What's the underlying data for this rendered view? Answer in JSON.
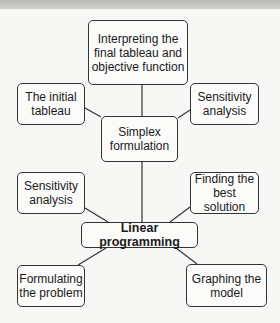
{
  "diagram": {
    "type": "mind-map",
    "center": "Linear programming",
    "nodes": [
      {
        "id": "linear",
        "label": "Linear programming"
      },
      {
        "id": "simplex",
        "label": "Simplex formulation"
      },
      {
        "id": "interpreting",
        "label": "Interpreting the final tableau and objective function"
      },
      {
        "id": "initial",
        "label": "The initial tableau"
      },
      {
        "id": "sens_right",
        "label": "Sensitivity analysis"
      },
      {
        "id": "sens_left",
        "label": "Sensitivity analysis"
      },
      {
        "id": "finding",
        "label": "Finding the best solution"
      },
      {
        "id": "formulating",
        "label": "Formulating the problem"
      },
      {
        "id": "graphing",
        "label": "Graphing the model"
      }
    ],
    "edges": [
      [
        "linear",
        "simplex"
      ],
      [
        "linear",
        "sens_left"
      ],
      [
        "linear",
        "finding"
      ],
      [
        "linear",
        "formulating"
      ],
      [
        "linear",
        "graphing"
      ],
      [
        "simplex",
        "interpreting"
      ],
      [
        "simplex",
        "initial"
      ],
      [
        "simplex",
        "sens_right"
      ]
    ]
  },
  "labels": {
    "interpreting": "Interpreting the final tableau and objective function",
    "initial": "The initial tableau",
    "sens_right": "Sensitivity analysis",
    "simplex": "Simplex formulation",
    "sens_left": "Sensitivity analysis",
    "finding": "Finding the best solution",
    "linear": "Linear programming",
    "formulating": "Formulating the problem",
    "graphing": "Graphing the model"
  }
}
